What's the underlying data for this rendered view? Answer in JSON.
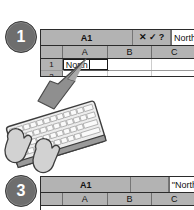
{
  "figure": {
    "background_color": "#ffffff"
  },
  "steps": [
    {
      "number": "1",
      "badge_color": "#6e6e6e"
    },
    {
      "number": "3",
      "badge_color": "#6e6e6e"
    }
  ],
  "step1": {
    "sheet": {
      "name_box": "A1",
      "formula_icons": [
        {
          "name": "cancel-icon",
          "glyph": "✕"
        },
        {
          "name": "confirm-icon",
          "glyph": "✓"
        },
        {
          "name": "help-icon",
          "glyph": "?"
        }
      ],
      "formula_value": "North",
      "column_headers": [
        "A",
        "B",
        "C"
      ],
      "rows": [
        {
          "header": "1",
          "cells": [
            "North",
            "",
            ""
          ]
        },
        {
          "header": "2",
          "cells": [
            "",
            "",
            ""
          ]
        }
      ],
      "active_cell": "A1"
    }
  },
  "step3": {
    "sheet": {
      "name_box": "A1",
      "formula_value": "\"North",
      "column_headers": [
        "A",
        "B",
        "C"
      ]
    }
  },
  "illustration": {
    "arrow": {
      "name": "pointer-arrow",
      "color": "#8a8a8a",
      "points_to": "A1"
    },
    "keyboard": {
      "name": "keyboard-illustration",
      "color": "#e8e8e8"
    },
    "hands": {
      "name": "typing-hands-illustration",
      "color": "#d4d4d4"
    }
  }
}
